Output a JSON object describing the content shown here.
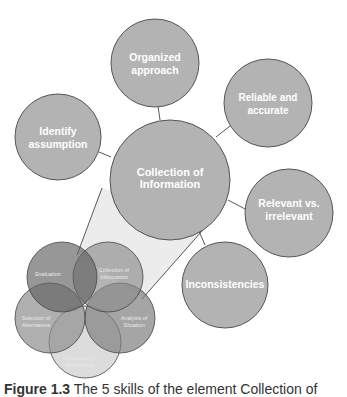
{
  "diagram": {
    "center": {
      "label_line1": "Collection of",
      "label_line2": "Information"
    },
    "satellites": [
      {
        "id": "organized",
        "line1": "Organized",
        "line2": "approach"
      },
      {
        "id": "reliable",
        "line1": "Reliable and",
        "line2": "accurate"
      },
      {
        "id": "identify",
        "line1": "Identify",
        "line2": "assumption"
      },
      {
        "id": "relevant",
        "line1": "Relevant vs.",
        "line2": "irrelevant"
      },
      {
        "id": "inconsistencies",
        "line1": "Inconsistencies",
        "line2": ""
      }
    ],
    "cluster": [
      {
        "id": "evaluation",
        "line1": "Evaluation",
        "line2": ""
      },
      {
        "id": "collection",
        "line1": "Collection of",
        "line2": "Information"
      },
      {
        "id": "analysis",
        "line1": "Analysis of",
        "line2": "Situation"
      },
      {
        "id": "generation",
        "line1": "Generation of",
        "line2": "Alternatives"
      },
      {
        "id": "selection",
        "line1": "Selection of",
        "line2": "Alternatives"
      }
    ],
    "colors": {
      "circle_fill": "#b3b3b3",
      "circle_stroke": "#555555",
      "wedge_fill": "#ececec",
      "text": "#ffffff"
    }
  },
  "caption": {
    "figure_number": "Figure 1.3",
    "text": " The 5 skills of the element Collection of"
  }
}
